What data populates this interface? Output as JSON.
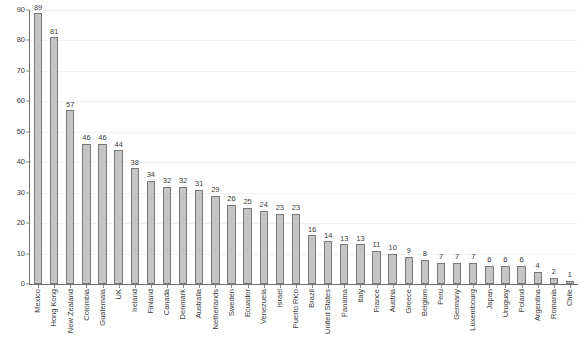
{
  "chart_data": {
    "type": "bar",
    "title": "",
    "subtitle": "",
    "xlabel": "",
    "ylabel": "",
    "ylim": [
      0,
      90
    ],
    "y_ticks": [
      0,
      10,
      20,
      30,
      40,
      50,
      60,
      70,
      80,
      90
    ],
    "grid": true,
    "legend": null,
    "bar_color": "#c4c4c4",
    "bar_border_color": "#7a7a7a",
    "axis_color": "#6e6e6e",
    "text_color": "#3c3c3c",
    "gridline_color": "#f2f2f2",
    "categories": [
      "Mexico",
      "Hong Kong",
      "New Zealand",
      "Colombia",
      "Guatemala",
      "UK",
      "Ireland",
      "Finland",
      "Canada",
      "Denmark",
      "Australia",
      "Netherlands",
      "Sweden",
      "Ecuador",
      "Venezuela",
      "Israel",
      "Puerto Rico",
      "Brazil",
      "United States",
      "Panama",
      "Italy",
      "France",
      "Austria",
      "Greece",
      "Belgium",
      "Peru",
      "Germany",
      "Luxembourg",
      "Japan",
      "Uruguay",
      "Poland",
      "Argentina",
      "Romania",
      "Chile"
    ],
    "values": [
      89,
      81,
      57,
      46,
      46,
      44,
      38,
      34,
      32,
      32,
      31,
      29,
      26,
      25,
      24,
      23,
      23,
      16,
      14,
      13,
      13,
      11,
      10,
      9,
      8,
      7,
      7,
      7,
      6,
      6,
      6,
      4,
      2,
      1
    ]
  },
  "footer": {
    "text": ""
  }
}
